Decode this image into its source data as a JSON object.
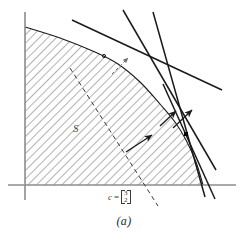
{
  "figure": {
    "caption": "(a)",
    "region_label": "S",
    "cost_vector": {
      "name": "c",
      "equals": "=",
      "components": [
        "3",
        "2"
      ]
    }
  },
  "colors": {
    "axis": "#8c8c8c",
    "line": "#1a1a1a",
    "hatch": "#555555",
    "dashed": "#3a3a3a",
    "point": "#000000",
    "background": "#ffffff"
  },
  "chart_data": {
    "type": "scatter",
    "title": "",
    "subtitle": "",
    "xlabel": "",
    "ylabel": "",
    "xlim": [
      0,
      248
    ],
    "ylim": [
      0,
      246
    ],
    "grid": false,
    "legend": "none",
    "axes": {
      "x_axis": {
        "x1": 8,
        "y1": 185,
        "x2": 236,
        "y2": 185
      },
      "y_axis": {
        "x1": 25,
        "y1": 12,
        "x2": 25,
        "y2": 200
      }
    },
    "feasible_region": {
      "name": "S",
      "description": "convex hatched region bounded by the axes and a concave boundary curve",
      "boundary_points": [
        [
          25,
          27
        ],
        [
          60,
          38
        ],
        [
          95,
          52
        ],
        [
          118,
          64
        ],
        [
          140,
          82
        ],
        [
          160,
          104
        ],
        [
          175,
          122
        ],
        [
          186,
          140
        ],
        [
          196,
          162
        ],
        [
          203,
          185
        ]
      ],
      "hatch_angle_deg": 45,
      "hatch_spacing_px": 6
    },
    "constraint_lines": [
      {
        "name": "supporting-line-upper",
        "x1": 72,
        "y1": 20,
        "x2": 222,
        "y2": 90
      },
      {
        "name": "supporting-line-steep-left",
        "x1": 123,
        "y1": 10,
        "x2": 216,
        "y2": 170
      },
      {
        "name": "supporting-line-steep-right",
        "x1": 153,
        "y1": 12,
        "x2": 205,
        "y2": 197
      },
      {
        "name": "supporting-line-optimal",
        "x1": 163,
        "y1": 84,
        "x2": 215,
        "y2": 199
      }
    ],
    "dashed_level_line": {
      "name": "objective-level-set",
      "x1": 70,
      "y1": 68,
      "x2": 158,
      "y2": 206
    },
    "gradient_arrows": [
      {
        "name": "gradient-arrow-lower",
        "x1": 126,
        "y1": 152,
        "x2": 152,
        "y2": 135
      },
      {
        "name": "gradient-arrow-middle",
        "x1": 160,
        "y1": 126,
        "x2": 176,
        "y2": 111
      },
      {
        "name": "gradient-arrow-upper",
        "x1": 173,
        "y1": 128,
        "x2": 192,
        "y2": 110
      }
    ],
    "dashed_arrow": {
      "name": "normal-direction-arrow",
      "x1": 112,
      "y1": 74,
      "x2": 128,
      "y2": 58
    },
    "optimal_point": {
      "name": "optimal-solution",
      "x": 186,
      "y": 134,
      "size": 4
    },
    "vertex_points": [
      {
        "name": "upper-vertex",
        "x": 104,
        "y": 56
      }
    ]
  }
}
